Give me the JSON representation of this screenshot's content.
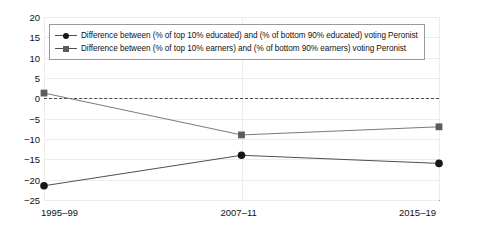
{
  "chart_data": {
    "type": "line",
    "title": "",
    "subtitle": "",
    "xlabel": "",
    "ylabel": "",
    "categories": [
      "1995–99",
      "2007–11",
      "2015–19"
    ],
    "ylim": [
      -25,
      20
    ],
    "ytick_labels": [
      "20",
      "15",
      "10",
      "5",
      "0",
      "−5",
      "−10",
      "−15",
      "−20",
      "−25"
    ],
    "ytick_values": [
      20,
      15,
      10,
      5,
      0,
      -5,
      -10,
      -15,
      -20,
      -25
    ],
    "grid": true,
    "grid_axis": "both",
    "legend_position": "top-left",
    "reference_line": {
      "value": 0,
      "style": "dashed",
      "color": "#4a4a4a"
    },
    "series": [
      {
        "name": "Difference between (% of top 10% educated) and (% of bottom 90% educated) voting Peronist",
        "marker": "circle",
        "color": "#171717",
        "line_color": "#4f4f4f",
        "values": [
          -21.5,
          -14,
          -16
        ]
      },
      {
        "name": "Difference between (% of top 10% earners) and (% of bottom 90% earners) voting Peronist",
        "marker": "square",
        "color": "#5c5c5c",
        "line_color": "#7a7a7a",
        "values": [
          1.3,
          -9,
          -7
        ]
      }
    ]
  },
  "axis": {
    "x_labels": [
      "1995–99",
      "2007–11",
      "2015–19"
    ],
    "y_labels": [
      "20",
      "15",
      "10",
      "5",
      "0",
      "−5",
      "−10",
      "−15",
      "−20",
      "−25"
    ]
  },
  "legend": {
    "items": [
      {
        "marker": "circle",
        "label": "Difference between (% of top 10% educated) and (% of bottom 90% educated) voting Peronist"
      },
      {
        "marker": "square",
        "label": "Difference between (% of top 10% earners) and (% of bottom 90% earners) voting Peronist"
      }
    ]
  },
  "colors": {
    "series_educated": "#171717",
    "series_earners": "#5c5c5c",
    "grid": "#ececec",
    "axis": "#9a9a9a",
    "zero_line": "#4a4a4a",
    "background": "#ffffff"
  }
}
